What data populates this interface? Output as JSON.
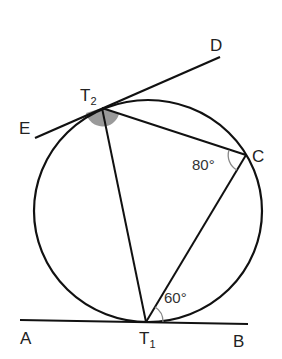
{
  "diagram": {
    "type": "circle-geometry",
    "colors": {
      "stroke": "#111111",
      "angle_fill": "#9a9a9a",
      "angle_arc": "#888888"
    },
    "points": {
      "A": {
        "label": "A"
      },
      "B": {
        "label": "B"
      },
      "C": {
        "label": "C"
      },
      "D": {
        "label": "D"
      },
      "E": {
        "label": "E"
      },
      "T1": {
        "label": "T",
        "sub": "1"
      },
      "T2": {
        "label": "T",
        "sub": "2"
      }
    },
    "angles": {
      "at_C": "80°",
      "at_T1": "60°"
    },
    "segments": [
      "A-B tangent at T1",
      "E-D tangent at T2",
      "T2-C",
      "C-T1",
      "T2-T1"
    ]
  }
}
